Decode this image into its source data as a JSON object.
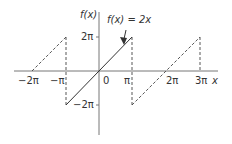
{
  "diagram": {
    "title_label": "f(x) = 2x",
    "y_axis_label": "f(x)",
    "x_axis_label": "x",
    "x_ticks": [
      {
        "label": "−2π",
        "x": 32
      },
      {
        "label": "−π",
        "x": 66
      },
      {
        "label": "0",
        "x": 99
      },
      {
        "label": "π",
        "x": 132
      },
      {
        "label": "2π",
        "x": 167
      },
      {
        "label": "3π",
        "x": 200
      }
    ],
    "y_ticks": [
      {
        "label": "2π",
        "y": 37
      },
      {
        "label": "−2π",
        "y": 105
      }
    ],
    "colors": {
      "line": "#333333",
      "axis": "#666666",
      "text": "#333333"
    }
  }
}
